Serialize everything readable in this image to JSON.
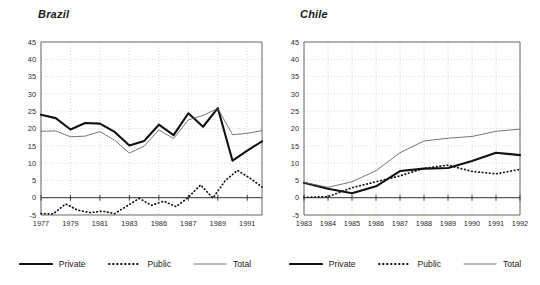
{
  "chart_data": [
    {
      "type": "line",
      "title": "Brazil",
      "xlabel": "",
      "ylabel": "",
      "ylim": [
        -5,
        45
      ],
      "yticks": [
        45,
        40,
        35,
        30,
        25,
        20,
        15,
        10,
        5,
        0,
        -5
      ],
      "grid": true,
      "legend_position": "bottom",
      "x": [
        1977,
        1978,
        1979,
        1980,
        1981,
        1982,
        1983,
        1984,
        1985,
        1986,
        1987,
        1988,
        1989,
        1990,
        1991,
        1992
      ],
      "tick_labels": [
        "1977",
        "1979",
        "1981",
        "1983",
        "1986",
        "1987",
        "1989",
        "1991"
      ],
      "tick_values": [
        1977,
        1979,
        1981,
        1983,
        1985,
        1987,
        1989,
        1991
      ],
      "series": [
        {
          "name": "Private",
          "style": "thick-solid",
          "color": "#111111",
          "values": [
            24.0,
            23.0,
            19.7,
            21.6,
            21.4,
            19.0,
            15.1,
            16.4,
            21.1,
            18.1,
            24.4,
            20.5,
            25.9,
            10.7,
            13.6,
            16.3
          ]
        },
        {
          "name": "Public",
          "style": "dotted",
          "color": "#111111",
          "values": [
            -4.6,
            -4.7,
            -1.8,
            -3.6,
            -4.3,
            -3.9,
            -4.6,
            -2.4,
            -0.2,
            -2.2,
            -1.0,
            -2.6,
            0.1,
            3.7,
            -0.1,
            4.9,
            7.9,
            5.7,
            3.1
          ]
        },
        {
          "name": "Total",
          "style": "thin-solid",
          "color": "#555555",
          "values": [
            19.2,
            19.3,
            17.6,
            17.8,
            19.1,
            16.6,
            12.9,
            14.9,
            19.6,
            17.1,
            22.5,
            23.8,
            25.8,
            18.2,
            18.6,
            19.4
          ]
        }
      ]
    },
    {
      "type": "line",
      "title": "Chile",
      "xlabel": "",
      "ylabel": "",
      "ylim": [
        -5,
        45
      ],
      "yticks": [
        45,
        40,
        35,
        30,
        25,
        20,
        15,
        10,
        5,
        0,
        -5
      ],
      "grid": true,
      "legend_position": "bottom",
      "x": [
        1983,
        1984,
        1985,
        1986,
        1987,
        1988,
        1989,
        1990,
        1991,
        1992
      ],
      "tick_labels": [
        "1983",
        "1984",
        "1985",
        "1986",
        "1987",
        "1988",
        "1989",
        "1990",
        "1991",
        "1992"
      ],
      "tick_values": [
        1983,
        1984,
        1985,
        1986,
        1987,
        1988,
        1989,
        1990,
        1991,
        1992
      ],
      "series": [
        {
          "name": "Private",
          "style": "thick-solid",
          "color": "#111111",
          "values": [
            4.3,
            2.6,
            1.3,
            3.3,
            7.7,
            8.4,
            8.6,
            10.6,
            13.0,
            12.3
          ]
        },
        {
          "name": "Public",
          "style": "dotted",
          "color": "#111111",
          "values": [
            0.1,
            0.3,
            2.9,
            4.6,
            6.3,
            8.5,
            9.4,
            7.6,
            6.9,
            8.2
          ]
        },
        {
          "name": "Total",
          "style": "thin-solid",
          "color": "#555555",
          "values": [
            4.4,
            3.0,
            4.6,
            7.8,
            13.0,
            16.4,
            17.2,
            17.7,
            19.2,
            19.8
          ]
        }
      ]
    }
  ],
  "legend": {
    "items": [
      {
        "label": "Private",
        "style": "thick-solid"
      },
      {
        "label": "Public",
        "style": "dotted"
      },
      {
        "label": "Total",
        "style": "thin-solid"
      }
    ]
  },
  "colors": {
    "private": "#111111",
    "public": "#111111",
    "total": "#666666",
    "grid": "#bdbdbd",
    "axis": "#555555",
    "text": "#1a1a1a",
    "background": "#ffffff"
  }
}
